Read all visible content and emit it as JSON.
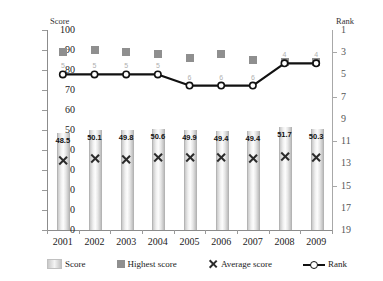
{
  "chart_data": {
    "type": "bar",
    "title": "",
    "categories": [
      "2001",
      "2002",
      "2003",
      "2004",
      "2005",
      "2006",
      "2007",
      "2008",
      "2009"
    ],
    "xlabel": "",
    "ylabel": "Score",
    "y2label": "Rank",
    "ylim": [
      0,
      100
    ],
    "y2lim": [
      19,
      1
    ],
    "y_ticks": [
      "100",
      "90",
      "80",
      "70",
      "60",
      "50",
      "40",
      "30",
      "20",
      "10",
      "0"
    ],
    "y2_ticks": [
      "1",
      "3",
      "5",
      "7",
      "9",
      "11",
      "13",
      "15",
      "17",
      "19"
    ],
    "grid": false,
    "legend_position": "bottom",
    "series": [
      {
        "name": "Score",
        "type": "bar",
        "axis": "left",
        "values": [
          48.5,
          50.1,
          49.8,
          50.6,
          49.9,
          49.4,
          49.4,
          51.7,
          50.3
        ],
        "labels": [
          "48.5",
          "50.1",
          "49.8",
          "50.6",
          "49.9",
          "49.4",
          "49.4",
          "51.7",
          "50.3"
        ]
      },
      {
        "name": "Highest score",
        "type": "scatter",
        "axis": "left",
        "marker": "square",
        "values": [
          89,
          90,
          89,
          88,
          86,
          88,
          85,
          84,
          84
        ]
      },
      {
        "name": "Average score",
        "type": "scatter",
        "axis": "left",
        "marker": "x",
        "values": [
          35.0,
          36.0,
          35.5,
          36.2,
          36.5,
          36.4,
          36.0,
          36.7,
          36.5
        ]
      },
      {
        "name": "Rank",
        "type": "line",
        "axis": "right",
        "marker": "circle",
        "values": [
          5,
          5,
          5,
          5,
          6,
          6,
          6,
          4,
          4
        ],
        "labels": [
          "5",
          "5",
          "5",
          "5",
          "6",
          "6",
          "6",
          "4",
          "4"
        ]
      }
    ]
  },
  "legend": {
    "items": [
      {
        "label": "Score",
        "marker": "bar-swatch"
      },
      {
        "label": "Highest score",
        "marker": "square-swatch"
      },
      {
        "label": "Average score",
        "marker": "x-swatch"
      },
      {
        "label": "Rank",
        "marker": "line-circle-swatch"
      }
    ]
  }
}
